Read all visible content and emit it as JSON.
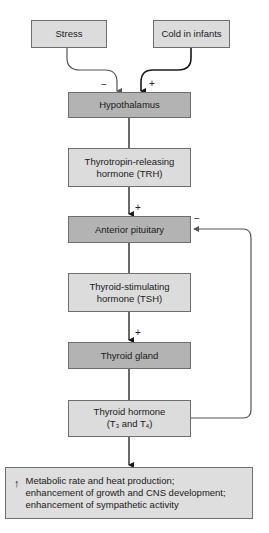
{
  "diagram": {
    "type": "flowchart",
    "topic": "Regulation of thyroid hormone secretion",
    "inputs": [
      {
        "id": "stress",
        "label": "Stress",
        "effect_sign": "−"
      },
      {
        "id": "cold",
        "label": "Cold in infants",
        "effect_sign": "+"
      }
    ],
    "nodes": [
      {
        "id": "hypothalamus",
        "label": "Hypothalamus",
        "shade": "dark"
      },
      {
        "id": "trh",
        "label_line1": "Thyrotropin-releasing",
        "label_line2": "hormone (TRH)",
        "shade": "light"
      },
      {
        "id": "anterior_pituitary",
        "label": "Anterior pituitary",
        "shade": "dark"
      },
      {
        "id": "tsh",
        "label_line1": "Thyroid-stimulating",
        "label_line2": "hormone (TSH)",
        "shade": "light"
      },
      {
        "id": "thyroid_gland",
        "label": "Thyroid gland",
        "shade": "dark"
      },
      {
        "id": "thyroid_hormone",
        "label_line1": "Thyroid hormone",
        "label_pre": "(T",
        "sub1": "3",
        "label_mid": " and T",
        "sub2": "4",
        "label_post": ")",
        "shade": "light"
      }
    ],
    "signs": {
      "trh_to_pituitary": "+",
      "tsh_to_thyroid": "+",
      "feedback": "−"
    },
    "outcome": {
      "icon": "↑",
      "line1": "Metabolic rate and heat production;",
      "line2": "enhancement of growth and CNS development;",
      "line3": "enhancement of sympathetic activity"
    },
    "colors": {
      "light_box": "#dcdcdc",
      "dark_box": "#b3b3b3",
      "line": "#1a1a1a",
      "stress_line": "#555555",
      "feedback_line": "#555555"
    }
  }
}
